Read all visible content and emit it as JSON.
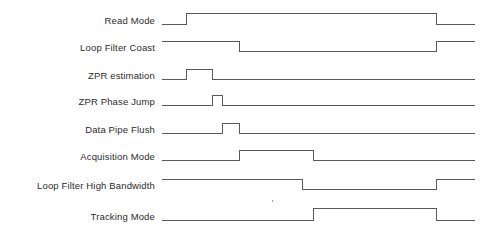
{
  "diagram": {
    "width": 494,
    "height": 235,
    "stroke_color": "#5a5a5a",
    "label_color": "#2b2b2b",
    "background_color": "#ffffff",
    "wave_start_x": 162,
    "wave_end_x": 475,
    "label_right_x": 155
  },
  "chart_data": {
    "type": "line",
    "subtype": "digital-timing-waveform",
    "title": "",
    "xlabel": "",
    "ylabel": "",
    "xlim": [
      162,
      475
    ],
    "grid": false,
    "legend": "none",
    "signal_names": [
      "Read Mode",
      "Loop Filter Coast",
      "ZPR estimation",
      "ZPR Phase Jump",
      "Data Pipe Flush",
      "Acquisition Mode",
      "Loop Filter High Bandwidth",
      "Tracking Mode"
    ],
    "series": [
      {
        "name": "Read Mode",
        "initial_level": 0,
        "baseline_y": 24,
        "high_y": 13,
        "transitions": [
          {
            "x": 186,
            "to": 1
          },
          {
            "x": 436,
            "to": 0
          }
        ]
      },
      {
        "name": "Loop Filter Coast",
        "initial_level": 1,
        "baseline_y": 51,
        "high_y": 41,
        "transitions": [
          {
            "x": 239,
            "to": 0
          },
          {
            "x": 436,
            "to": 1
          }
        ]
      },
      {
        "name": "ZPR estimation",
        "initial_level": 0,
        "baseline_y": 79,
        "high_y": 69,
        "transitions": [
          {
            "x": 186,
            "to": 1
          },
          {
            "x": 212,
            "to": 0
          }
        ]
      },
      {
        "name": "ZPR Phase Jump",
        "initial_level": 0,
        "baseline_y": 105,
        "high_y": 95,
        "transitions": [
          {
            "x": 212,
            "to": 1
          },
          {
            "x": 222,
            "to": 0
          }
        ]
      },
      {
        "name": "Data Pipe Flush",
        "initial_level": 0,
        "baseline_y": 133,
        "high_y": 123,
        "transitions": [
          {
            "x": 222,
            "to": 1
          },
          {
            "x": 239,
            "to": 0
          }
        ]
      },
      {
        "name": "Acquisition Mode",
        "initial_level": 0,
        "baseline_y": 160,
        "high_y": 150,
        "transitions": [
          {
            "x": 239,
            "to": 1
          },
          {
            "x": 313,
            "to": 0
          }
        ]
      },
      {
        "name": "Loop Filter High Bandwidth",
        "initial_level": 1,
        "baseline_y": 189,
        "high_y": 179,
        "transitions": [
          {
            "x": 302,
            "to": 0
          },
          {
            "x": 436,
            "to": 1
          }
        ]
      },
      {
        "name": "Tracking Mode",
        "initial_level": 0,
        "baseline_y": 220,
        "high_y": 208,
        "transitions": [
          {
            "x": 313,
            "to": 1
          },
          {
            "x": 436,
            "to": 0
          }
        ]
      }
    ],
    "artifacts": [
      {
        "name": "stray-mark",
        "x": 272,
        "y": 200
      }
    ]
  }
}
